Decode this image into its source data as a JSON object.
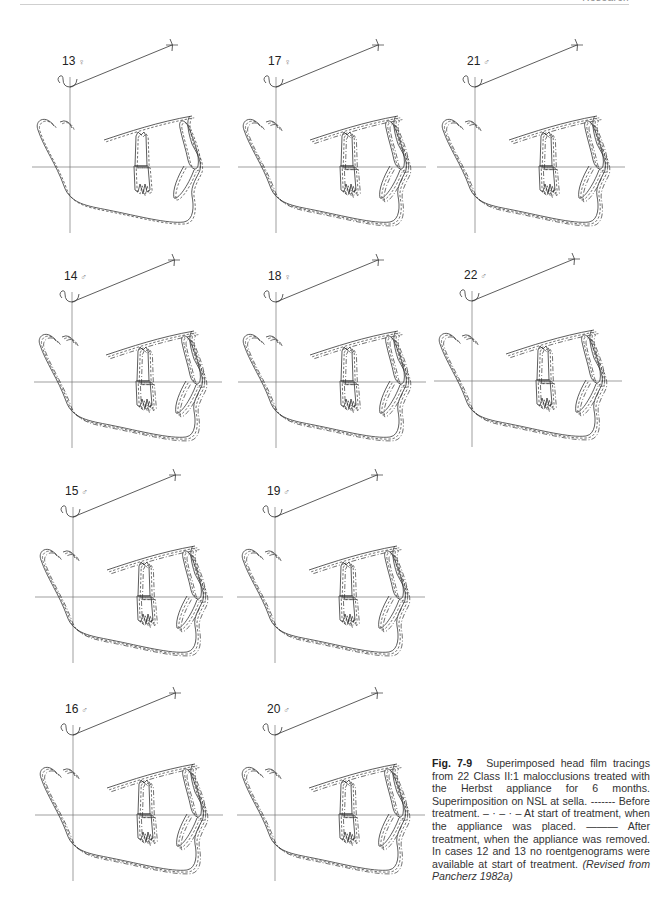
{
  "header": {
    "running_head": "Research"
  },
  "figure": {
    "number": "Fig. 7-9",
    "caption_parts": {
      "main": "Superimposed head film tracings from 22 Class II:1 malocclusions treated with the Herbst appliance for 6 months. Superimposition on NSL at sella.",
      "legend_before_symbol": "-------",
      "legend_before": "Before treatment.",
      "legend_start_symbol": "– · – · –",
      "legend_start": "At start of treatment, when the appliance was placed.",
      "legend_after_symbol": "———",
      "legend_after": "After treatment, when the appliance was removed. In cases 12 and 13 no roentgenograms were available at start of treatment.",
      "source": "(Revised from Pancherz 1982a)"
    },
    "panels": [
      {
        "case": "13",
        "sex": "♀",
        "vx": 70,
        "hy": 167
      },
      {
        "case": "17",
        "sex": "♀",
        "vx": 276,
        "hy": 167
      },
      {
        "case": "21",
        "sex": "♂",
        "vx": 475,
        "hy": 167
      },
      {
        "case": "14",
        "sex": "♂",
        "vx": 72,
        "hy": 382
      },
      {
        "case": "18",
        "sex": "♀",
        "vx": 276,
        "hy": 382
      },
      {
        "case": "22",
        "sex": "♂",
        "vx": 472,
        "hy": 381
      },
      {
        "case": "15",
        "sex": "♂",
        "vx": 73,
        "hy": 597
      },
      {
        "case": "19",
        "sex": "♂",
        "vx": 275,
        "hy": 597
      },
      {
        "case": "16",
        "sex": "♂",
        "vx": 73,
        "hy": 815
      },
      {
        "case": "20",
        "sex": "♂",
        "vx": 275,
        "hy": 815
      }
    ],
    "line_styles": {
      "before": "dashed",
      "start": "dash-dot",
      "after": "solid"
    },
    "colors": {
      "line": "#333333",
      "grid": "#777777",
      "sex_symbol": "#888888"
    }
  }
}
